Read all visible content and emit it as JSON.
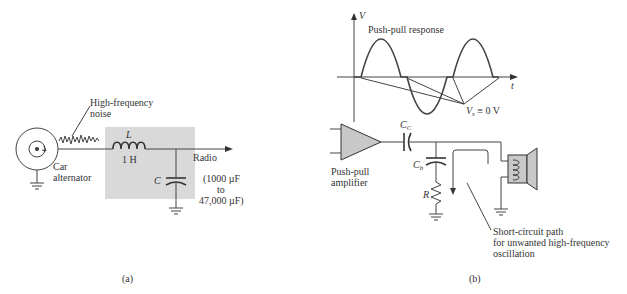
{
  "figure_a": {
    "caption": "(a)",
    "noise_label_line1": "High-frequency",
    "noise_label_line2": "noise",
    "source_label_line1": "Car",
    "source_label_line2": "alternator",
    "inductor_symbol": "L",
    "inductor_value": "1 H",
    "capacitor_symbol": "C",
    "output_label": "Radio",
    "cap_range_line1": "(1000 µF",
    "cap_range_line2": "to",
    "cap_range_line3": "47,000 µF)",
    "shade_color": "#d9d9d9"
  },
  "figure_b": {
    "caption": "(b)",
    "plot_title": "Push-pull response",
    "y_axis_label": "V",
    "x_axis_label": "t",
    "annotation_vs": "V",
    "annotation_vs_sub": "s",
    "annotation_vs_rest": " ≡ 0 V",
    "amplifier_label_line1": "Push-pull",
    "amplifier_label_line2": "amplifier",
    "coupling_cap_symbol": "C",
    "coupling_cap_sub": "C",
    "bypass_cap_symbol": "C",
    "bypass_cap_sub": "b",
    "resistor_symbol": "R",
    "path_label_line1": "Short-circuit path",
    "path_label_line2": "for unwanted high-frequency",
    "path_label_line3": "oscillation",
    "amp_fill": "#c8c8c8",
    "speaker_fill": "#c8c8c8"
  }
}
